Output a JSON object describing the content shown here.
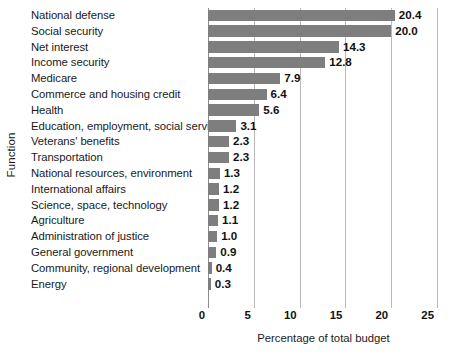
{
  "chart_data": {
    "type": "bar",
    "orientation": "horizontal",
    "title": "",
    "xlabel": "Percentage of total budget",
    "ylabel": "Function",
    "xlim": [
      0,
      25
    ],
    "xticks": [
      0,
      5,
      10,
      15,
      20,
      25
    ],
    "xtick_labels": [
      "0",
      "5",
      "10",
      "15",
      "20",
      "25"
    ],
    "grid": "vertical",
    "legend": "none",
    "bar_color": "#7e7e7e",
    "gridline_color": "#b9b9b9",
    "categories": [
      "National defense",
      "Social security",
      "Net interest",
      "Income security",
      "Medicare",
      "Commerce and housing credit",
      "Health",
      "Education, employment, social services",
      "Veterans' benefits",
      "Transportation",
      "National resources, environment",
      "International affairs",
      "Science, space, technology",
      "Agriculture",
      "Administration of justice",
      "General government",
      "Community, regional development",
      "Energy"
    ],
    "values": [
      20.4,
      20.0,
      14.3,
      12.8,
      7.9,
      6.4,
      5.6,
      3.1,
      2.3,
      2.3,
      1.3,
      1.2,
      1.2,
      1.1,
      1.0,
      0.9,
      0.4,
      0.3
    ],
    "value_labels": [
      "20.4",
      "20.0",
      "14.3",
      "12.8",
      "7.9",
      "6.4",
      "5.6",
      "3.1",
      "2.3",
      "2.3",
      "1.3",
      "1.2",
      "1.2",
      "1.1",
      "1.0",
      "0.9",
      "0.4",
      "0.3"
    ]
  }
}
